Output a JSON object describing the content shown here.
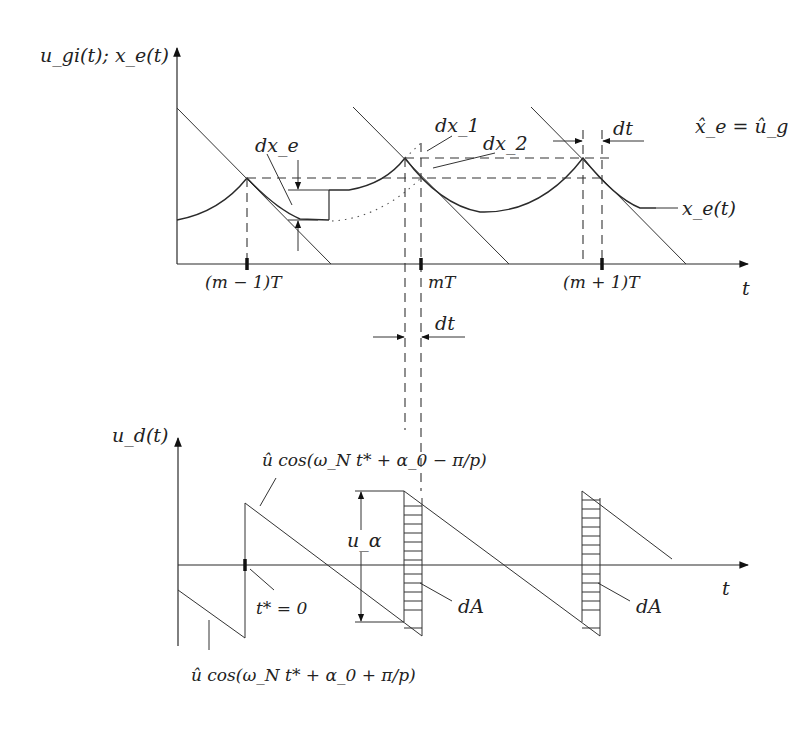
{
  "top_plot": {
    "y_axis_label": "u_gi(t); x_e(t)",
    "x_axis_label": "t",
    "ticks": [
      "(m − 1)T",
      "mT",
      "(m + 1)T"
    ],
    "annotations": {
      "dx_e": "dx_e",
      "dx_1": "dx_1",
      "dx_2": "dx_2",
      "dt": "dt",
      "equality": "x̂_e = û_g",
      "curve_label": "x_e(t)"
    }
  },
  "middle": {
    "dt_label": "dt"
  },
  "bottom_plot": {
    "y_axis_label": "u_d(t)",
    "x_axis_label": "t",
    "annotations": {
      "upper_cos": "û cos(ω_N t* + α_0 − π/p)",
      "lower_cos": "û cos(ω_N t* + α_0 + π/p)",
      "t_star": "t* = 0",
      "u_alpha": "u_α",
      "dA_1": "dA",
      "dA_2": "dA"
    }
  }
}
